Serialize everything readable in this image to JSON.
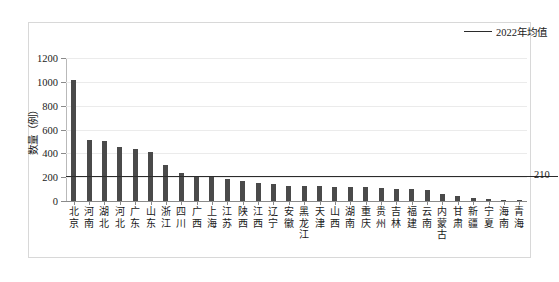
{
  "chart_data": {
    "type": "bar",
    "title": "",
    "xlabel": "",
    "ylabel": "数量（例）",
    "ylim": [
      0,
      1200
    ],
    "yticks": [
      0,
      200,
      400,
      600,
      800,
      1000,
      1200
    ],
    "ytick_labels": [
      "0",
      "200",
      "400",
      "600",
      "800",
      "1000",
      "1200"
    ],
    "grid": true,
    "legend_position": "top-right",
    "legend": [
      {
        "name": "2022年均值",
        "type": "line",
        "color": "#2b2b2b"
      }
    ],
    "bar_color": "#4a4a4a",
    "annotations": [
      {
        "text": "210",
        "value": 210,
        "kind": "average-line-label"
      }
    ],
    "reference_line": {
      "label": "2022年均值",
      "value": 210,
      "value_label": "210"
    },
    "categories": [
      "北京",
      "河南",
      "湖北",
      "河北",
      "广东",
      "山东",
      "浙江",
      "四川",
      "广西",
      "上海",
      "江苏",
      "陕西",
      "江西",
      "辽宁",
      "安徽",
      "黑龙江",
      "天津",
      "山西",
      "湖南",
      "重庆",
      "贵州",
      "吉林",
      "福建",
      "云南",
      "内蒙古",
      "甘肃",
      "新疆",
      "宁夏",
      "海南",
      "青海"
    ],
    "values": [
      1015,
      510,
      500,
      450,
      435,
      415,
      300,
      235,
      205,
      205,
      185,
      165,
      150,
      145,
      130,
      130,
      125,
      120,
      115,
      115,
      110,
      105,
      100,
      95,
      55,
      45,
      25,
      18,
      10,
      6
    ]
  }
}
